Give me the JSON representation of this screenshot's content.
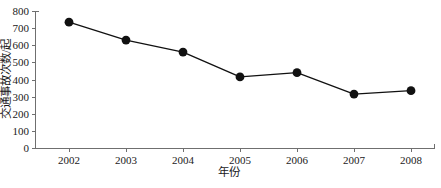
{
  "chart_data": {
    "type": "line",
    "title": "",
    "xlabel": "年份",
    "ylabel": "交通事故次数/起",
    "categories": [
      "2002",
      "2003",
      "2004",
      "2005",
      "2006",
      "2007",
      "2008"
    ],
    "values": [
      735,
      630,
      560,
      415,
      440,
      315,
      335
    ],
    "series": [
      {
        "name": "交通事故次数",
        "values": [
          735,
          630,
          560,
          415,
          440,
          315,
          335
        ]
      }
    ],
    "xlim": [
      2002,
      2008
    ],
    "ylim": [
      0,
      800
    ],
    "y_ticks": [
      "0",
      "100",
      "200",
      "300",
      "400",
      "500",
      "600",
      "700",
      "800"
    ],
    "y_tick_values": [
      0,
      100,
      200,
      300,
      400,
      500,
      600,
      700,
      800
    ],
    "y_tick_step": 100,
    "x_ticks": [
      "2002",
      "2003",
      "2004",
      "2005",
      "2006",
      "2007",
      "2008"
    ],
    "grid": false,
    "legend": false,
    "legend_position": "none",
    "marker": "filled-circle",
    "line_color": "#111111",
    "marker_color": "#111111",
    "axis_color": "#6f6f6f",
    "background_color": "#ffffff"
  }
}
